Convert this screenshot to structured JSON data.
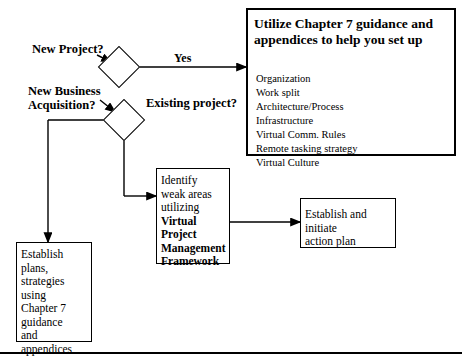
{
  "diagram": {
    "guidance": {
      "title": "Utilize Chapter 7 guidance and appendices to help you set up",
      "items_text": "Organization\nWork split\nArchitecture/Process\nInfrastructure\nVirtual Comm. Rules\nRemote tasking strategy\nVirtual Culture",
      "items": [
        "Organization",
        "Work split",
        "Architecture/Process",
        "Infrastructure",
        "Virtual Comm. Rules",
        "Remote tasking strategy",
        "Virtual Culture"
      ]
    },
    "decisions": {
      "new_project": "New Project?",
      "new_business": "New Business\nAcquisition?",
      "existing_project": "Existing project?"
    },
    "edge_labels": {
      "yes": "Yes"
    },
    "processes": {
      "establish_plans": "Establish\nplans,\nstrategies\nusing\nChapter 7\nguidance\nand\nappendices",
      "identify_lead": "Identify\nweak areas\nutilizing",
      "identify_bold": "Virtual Project\nManagement\nFramework",
      "establish_action": "Establish and initiate\naction plan"
    },
    "colors": {
      "stroke": "#000000",
      "fill": "#ffffff",
      "text": "#000000"
    }
  }
}
